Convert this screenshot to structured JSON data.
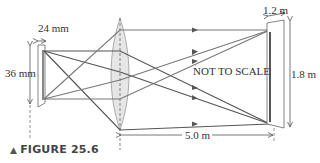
{
  "figure": {
    "caption_marker": "▲",
    "caption": "FIGURE 25.6"
  },
  "labels": {
    "slide_width": "24 mm",
    "slide_height": "36 mm",
    "screen_width": "1.2 m",
    "screen_height": "1.8 m",
    "distance": "5.0 m",
    "note": "NOT TO SCALE"
  },
  "colors": {
    "ray_dark": "#555555",
    "ray_light": "#777777",
    "lens_fill": "#e4e4e4",
    "lens_stroke": "#999999",
    "frame": "#666666",
    "text": "#333333"
  },
  "icons": {
    "caption_marker": "triangle-up-icon"
  }
}
